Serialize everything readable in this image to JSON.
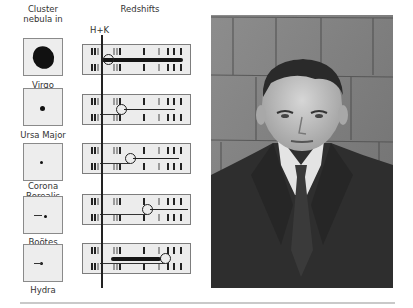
{
  "headers": {
    "cluster": "Cluster nebula in",
    "redshifts": "Redshifts",
    "hk_marker": "H+K"
  },
  "clusters": [
    {
      "name": "Virgo",
      "thumb_top": 38,
      "label_top": 80,
      "spec_top": 44,
      "shift_px": 6,
      "streak": "wide"
    },
    {
      "name": "Ursa Major",
      "thumb_top": 88,
      "label_top": 130,
      "spec_top": 94,
      "shift_px": 19,
      "streak": "thin"
    },
    {
      "name": "Corona Borealis",
      "thumb_top": 143,
      "label_top": 184,
      "spec_top": 143,
      "shift_px": 28,
      "streak": "thin"
    },
    {
      "name": "Boötes",
      "thumb_top": 196,
      "label_top": 237,
      "spec_top": 194,
      "shift_px": 45,
      "streak": "thin"
    },
    {
      "name": "Hydra",
      "thumb_top": 244,
      "label_top": 285,
      "spec_top": 243,
      "shift_px": 63,
      "streak": "wide"
    }
  ],
  "photo": {
    "description": "Black-and-white portrait of a man in a dark suit and tie before a shingled wall"
  },
  "colors": {
    "background": "#ffffff",
    "ink": "#222222",
    "spectrum_bg": "#ececec",
    "divider": "#c9c9c9"
  }
}
